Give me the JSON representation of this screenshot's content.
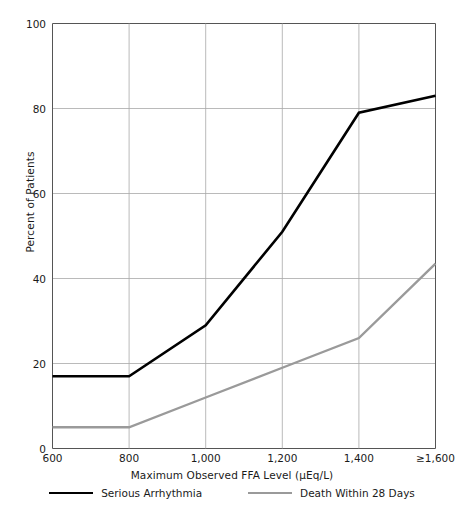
{
  "chart_data": {
    "type": "line",
    "title": "",
    "xlabel": "Maximum Observed FFA Level (μEq/L)",
    "ylabel": "Percent of Patients",
    "x": [
      600,
      800,
      1000,
      1200,
      1400,
      1600
    ],
    "xticklabels": [
      "600",
      "800",
      "1,000",
      "1,200",
      "1,400",
      "≥1,600"
    ],
    "yticklabels": [
      "0",
      "20",
      "40",
      "60",
      "80",
      "100"
    ],
    "yticks": [
      0,
      20,
      40,
      60,
      80,
      100
    ],
    "ylim": [
      0,
      100
    ],
    "xlim": [
      600,
      1600
    ],
    "grid": true,
    "legend_position": "bottom",
    "series": [
      {
        "name": "Serious Arrhythmia",
        "color": "#000000",
        "width": 2.6,
        "values": [
          17,
          17,
          29,
          51,
          79,
          83
        ]
      },
      {
        "name": "Death Within 28 Days",
        "color": "#9a9a9a",
        "width": 2.4,
        "values": [
          5,
          5,
          12,
          19,
          26,
          43.5
        ]
      }
    ]
  },
  "axis": {
    "ylabel": "Percent of Patients",
    "xlabel": "Maximum Observed FFA Level (μEq/L)"
  },
  "colors": {
    "axis": "#555555",
    "grid": "#a8a8a8",
    "series_primary": "#000000",
    "series_secondary": "#9a9a9a",
    "background": "#ffffff"
  }
}
